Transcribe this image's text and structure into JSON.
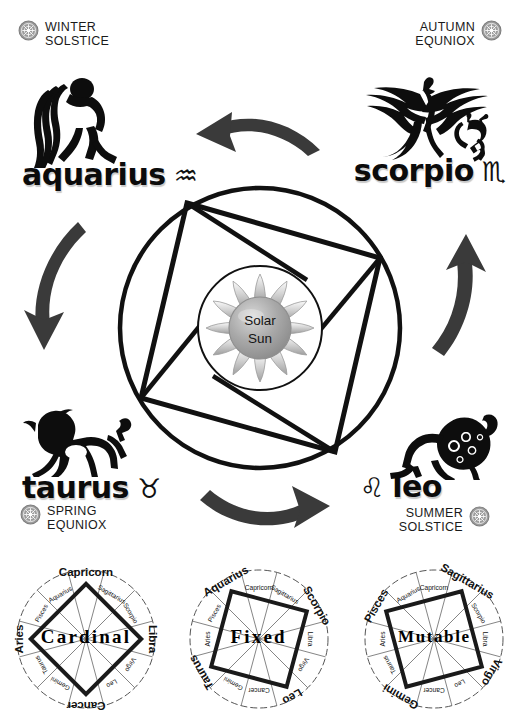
{
  "center": {
    "label_line1": "Solar",
    "label_line2": "Sun",
    "sun_color_outer": "#b4b4b4",
    "sun_color_inner": "#9a9a9a"
  },
  "seasons": [
    {
      "id": "winter-solstice",
      "line1": "WINTER",
      "line2": "SOLSTICE",
      "corner": "top-left"
    },
    {
      "id": "autumn-equinox",
      "line1": "AUTUMN",
      "line2": "EQUNIOX",
      "corner": "top-right"
    },
    {
      "id": "spring-equinox",
      "line1": "SPRING",
      "line2": "EQUNIOX",
      "corner": "bottom-left"
    },
    {
      "id": "summer-solstice",
      "line1": "SUMMER",
      "line2": "SOLSTICE",
      "corner": "bottom-right"
    }
  ],
  "corner_signs": [
    {
      "id": "aquarius",
      "name": "aquarius",
      "glyph": "♒",
      "season": "WINTER SOLSTICE",
      "figure": "water-bearer"
    },
    {
      "id": "scorpio",
      "name": "scorpio",
      "glyph": "♏",
      "season": "AUTUMN EQUNIOX",
      "figure": "phoenix-scorpion"
    },
    {
      "id": "taurus",
      "name": "taurus",
      "glyph": "♉",
      "season": "SPRING EQUNIOX",
      "figure": "bull"
    },
    {
      "id": "leo",
      "name": "leo",
      "glyph": "♌",
      "season": "SUMMER SOLSTICE",
      "figure": "lion"
    }
  ],
  "flow_arrows": [
    {
      "id": "arrow-top",
      "from": "scorpio",
      "to": "aquarius",
      "direction": "counterclockwise"
    },
    {
      "id": "arrow-left",
      "from": "aquarius",
      "to": "taurus",
      "direction": "counterclockwise"
    },
    {
      "id": "arrow-bottom",
      "from": "taurus",
      "to": "leo",
      "direction": "counterclockwise"
    },
    {
      "id": "arrow-right",
      "from": "leo",
      "to": "scorpio",
      "direction": "counterclockwise"
    }
  ],
  "zodiac_order": [
    "Capricorn",
    "Aquarius",
    "Pisces",
    "Aries",
    "Taurus",
    "Gemini",
    "Cancer",
    "Leo",
    "Virgo",
    "Libra",
    "Scorpio",
    "Sagittarius"
  ],
  "modalities": [
    {
      "id": "cardinal",
      "title": "Cardinal",
      "highlight": [
        "Capricorn",
        "Aries",
        "Cancer",
        "Libra"
      ],
      "square_rotation_deg": 45
    },
    {
      "id": "fixed",
      "title": "Fixed",
      "highlight": [
        "Aquarius",
        "Taurus",
        "Leo",
        "Scorpio"
      ],
      "square_rotation_deg": 15
    },
    {
      "id": "mutable",
      "title": "Mutable",
      "highlight": [
        "Pisces",
        "Gemini",
        "Virgo",
        "Sagittarius"
      ],
      "square_rotation_deg": -15
    }
  ]
}
